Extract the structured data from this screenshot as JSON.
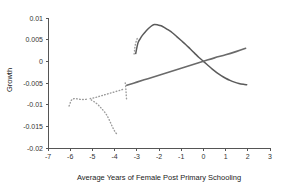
{
  "chart_data": {
    "type": "line",
    "title": "",
    "xlabel": "Average Years of Female Post Primary Schooling",
    "ylabel": "Growth",
    "xlim": [
      -7,
      3
    ],
    "ylim": [
      -0.02,
      0.01
    ],
    "grid": false,
    "legend": "none",
    "x_ticks": [
      "-7",
      "-6",
      "-5",
      "-4",
      "-3",
      "-2",
      "-1",
      "0",
      "1",
      "2",
      "3"
    ],
    "x_tick_values": [
      -7,
      -6,
      -5,
      -4,
      -3,
      -2,
      -1,
      0,
      1,
      2,
      3
    ],
    "y_ticks": [
      "0.01",
      "0.005",
      "0",
      "-0.005",
      "-0.01",
      "-0.015",
      "-0.02"
    ],
    "y_tick_values": [
      0.01,
      0.005,
      0,
      -0.005,
      -0.01,
      -0.015,
      -0.02
    ],
    "series": [
      {
        "name": "hump-shaped-curve",
        "style": "solid",
        "color": "#5a5a5a",
        "points": [
          [
            -3.05,
            0.0018
          ],
          [
            -2.95,
            0.0042
          ],
          [
            -2.85,
            0.0052
          ],
          [
            -2.75,
            0.006
          ],
          [
            -2.6,
            0.0069
          ],
          [
            -2.45,
            0.0077
          ],
          [
            -2.3,
            0.0083
          ],
          [
            -2.2,
            0.0085
          ],
          [
            -2.05,
            0.0084
          ],
          [
            -1.9,
            0.0082
          ],
          [
            -1.75,
            0.0078
          ],
          [
            -1.6,
            0.0073
          ],
          [
            -1.4,
            0.0066
          ],
          [
            -1.2,
            0.0057
          ],
          [
            -1.0,
            0.0048
          ],
          [
            -0.8,
            0.0039
          ],
          [
            -0.6,
            0.0029
          ],
          [
            -0.4,
            0.0019
          ],
          [
            -0.2,
            0.0009
          ],
          [
            0.0,
            0.0
          ],
          [
            0.2,
            -0.0009
          ],
          [
            0.4,
            -0.0018
          ],
          [
            0.6,
            -0.0026
          ],
          [
            0.8,
            -0.0033
          ],
          [
            1.0,
            -0.0039
          ],
          [
            1.2,
            -0.0044
          ],
          [
            1.4,
            -0.0048
          ],
          [
            1.6,
            -0.0051
          ],
          [
            1.8,
            -0.0053
          ],
          [
            1.95,
            -0.0054
          ]
        ]
      },
      {
        "name": "rising-straight-line",
        "style": "solid",
        "color": "#6a6a6a",
        "points": [
          [
            -3.45,
            -0.0055
          ],
          [
            -3.0,
            -0.0048
          ],
          [
            -2.5,
            -0.004
          ],
          [
            -2.0,
            -0.0032
          ],
          [
            -1.5,
            -0.0024
          ],
          [
            -1.0,
            -0.0016
          ],
          [
            -0.5,
            -0.0008
          ],
          [
            0.0,
            0.0
          ],
          [
            0.5,
            0.0008
          ],
          [
            1.0,
            0.0015
          ],
          [
            1.5,
            0.0023
          ],
          [
            1.9,
            0.003
          ]
        ]
      },
      {
        "name": "dotted-upper-branch",
        "style": "dotted",
        "color": "#9a9a9a",
        "points": [
          [
            -5.1,
            -0.0086
          ],
          [
            -4.9,
            -0.0084
          ],
          [
            -4.7,
            -0.0081
          ],
          [
            -4.5,
            -0.0078
          ],
          [
            -4.3,
            -0.0075
          ],
          [
            -4.1,
            -0.0072
          ],
          [
            -3.9,
            -0.0069
          ],
          [
            -3.7,
            -0.0066
          ],
          [
            -3.55,
            -0.0063
          ]
        ]
      },
      {
        "name": "dotted-left-cluster",
        "style": "dotted",
        "color": "#9a9a9a",
        "points": [
          [
            -6.05,
            -0.0103
          ],
          [
            -6.0,
            -0.0096
          ],
          [
            -5.95,
            -0.009
          ],
          [
            -5.88,
            -0.0087
          ],
          [
            -5.78,
            -0.0086
          ],
          [
            -5.65,
            -0.0087
          ],
          [
            -5.5,
            -0.0088
          ],
          [
            -5.35,
            -0.0088
          ],
          [
            -5.2,
            -0.0087
          ]
        ]
      },
      {
        "name": "dotted-descending-branch",
        "style": "dotted",
        "color": "#9a9a9a",
        "points": [
          [
            -5.05,
            -0.0089
          ],
          [
            -4.9,
            -0.0094
          ],
          [
            -4.75,
            -0.01
          ],
          [
            -4.62,
            -0.0107
          ],
          [
            -4.5,
            -0.0114
          ],
          [
            -4.38,
            -0.0122
          ],
          [
            -4.28,
            -0.0131
          ],
          [
            -4.18,
            -0.0142
          ],
          [
            -4.1,
            -0.0151
          ],
          [
            -4.02,
            -0.0159
          ],
          [
            -3.95,
            -0.0165
          ],
          [
            -3.88,
            -0.0168
          ]
        ]
      },
      {
        "name": "dotted-vertical-jump",
        "style": "dotted",
        "color": "#9a9a9a",
        "points": [
          [
            -3.52,
            -0.005
          ],
          [
            -3.5,
            -0.0058
          ],
          [
            -3.49,
            -0.0066
          ],
          [
            -3.48,
            -0.0074
          ],
          [
            -3.47,
            -0.0082
          ],
          [
            -3.46,
            -0.0088
          ]
        ]
      },
      {
        "name": "dotted-steep-rise",
        "style": "dotted",
        "color": "#9a9a9a",
        "points": [
          [
            -3.12,
            0.0017
          ],
          [
            -3.1,
            0.0026
          ],
          [
            -3.08,
            0.0034
          ],
          [
            -3.05,
            0.0042
          ],
          [
            -3.0,
            0.005
          ],
          [
            -2.95,
            0.0056
          ]
        ]
      }
    ]
  }
}
